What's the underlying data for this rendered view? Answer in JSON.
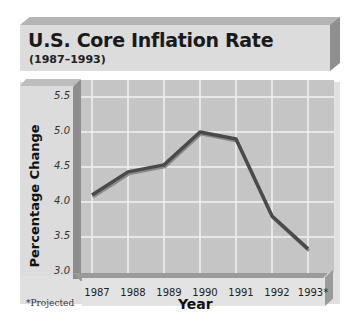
{
  "title": "U.S. Core Inflation Rate",
  "subtitle": "(1987–1993)",
  "footnote": "*Projected",
  "colors": {
    "plot_background": "#c5c5c5",
    "grid": "#f2f2f2",
    "line": "#4a4a4a",
    "panel": "#dcdcdc",
    "bevel_dark": "#8f8f8f"
  },
  "chart_data": {
    "type": "line",
    "title": "U.S. Core Inflation Rate",
    "subtitle": "(1987–1993)",
    "xlabel": "Year",
    "ylabel": "Percentage Change",
    "categories": [
      "1987",
      "1988",
      "1989",
      "1990",
      "1991",
      "1992",
      "1993*"
    ],
    "series": [
      {
        "name": "Core Inflation Rate",
        "values": [
          4.1,
          4.43,
          4.53,
          5.0,
          4.9,
          3.8,
          3.33
        ]
      }
    ],
    "yticks": [
      "3.0",
      "3.5",
      "4.0",
      "4.5",
      "5.0",
      "5.5"
    ],
    "ylim": [
      3.0,
      5.5
    ],
    "grid": true,
    "legend": "none",
    "annotations": [
      "*Projected"
    ]
  }
}
